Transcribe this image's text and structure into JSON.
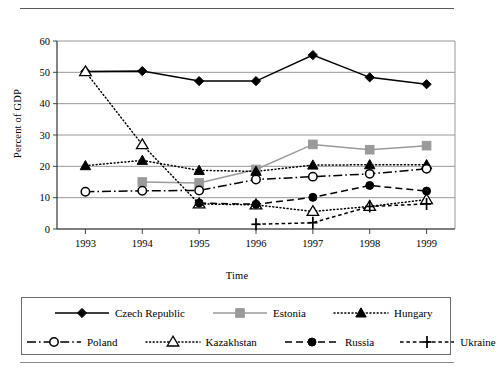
{
  "chart_data": {
    "type": "line",
    "title": "",
    "xlabel": "Time",
    "ylabel": "Percent of GDP",
    "categories": [
      "1993",
      "1994",
      "1995",
      "1996",
      "1997",
      "1998",
      "1999"
    ],
    "x": [
      1993,
      1994,
      1995,
      1996,
      1997,
      1998,
      1999
    ],
    "xlim": [
      1992.5,
      1999.5
    ],
    "ylim": [
      0,
      60
    ],
    "yticks": [
      0,
      10,
      20,
      30,
      40,
      50,
      60
    ],
    "ytick_labels": [
      "0",
      "10",
      "20",
      "30",
      "40",
      "50",
      "60"
    ],
    "grid": "horizontal",
    "legend_position": "below-plot",
    "series": [
      {
        "name": "Czech Republic",
        "color": "#000000",
        "marker": "diamond",
        "line_style": "solid",
        "x": [
          1993,
          1994,
          1995,
          1996,
          1997,
          1998,
          1999
        ],
        "values": [
          50.3,
          50.4,
          47.2,
          47.2,
          55.5,
          48.4,
          46.2
        ]
      },
      {
        "name": "Estonia",
        "color": "#9a9a9a",
        "marker": "square",
        "line_style": "solid",
        "x": [
          1994,
          1995,
          1996,
          1997,
          1998,
          1999
        ],
        "values": [
          15.0,
          14.7,
          19.0,
          27.0,
          25.3,
          26.6
        ]
      },
      {
        "name": "Hungary",
        "color": "#000000",
        "marker": "triangle-filled",
        "line_style": "dotted",
        "x": [
          1993,
          1994,
          1995,
          1996,
          1997,
          1998,
          1999
        ],
        "values": [
          20.2,
          21.9,
          18.7,
          18.4,
          20.4,
          20.5,
          20.5
        ]
      },
      {
        "name": "Poland",
        "color": "#000000",
        "marker": "circle-open",
        "line_style": "dash-dot",
        "x": [
          1993,
          1994,
          1995,
          1996,
          1997,
          1998,
          1999
        ],
        "values": [
          11.9,
          12.2,
          12.3,
          15.8,
          16.7,
          17.6,
          19.2
        ]
      },
      {
        "name": "Kazakhstan",
        "color": "#000000",
        "marker": "triangle-open",
        "line_style": "dotted",
        "x": [
          1993,
          1994,
          1995,
          1996,
          1997,
          1998,
          1999
        ],
        "values": [
          50.2,
          26.9,
          8.0,
          7.7,
          5.6,
          7.2,
          9.4
        ]
      },
      {
        "name": "Russia",
        "color": "#000000",
        "marker": "circle-filled",
        "line_style": "dashed",
        "x": [
          1995,
          1996,
          1997,
          1998,
          1999
        ],
        "values": [
          8.3,
          7.9,
          10.1,
          13.9,
          12.1
        ]
      },
      {
        "name": "Ukraine",
        "color": "#000000",
        "marker": "plus",
        "line_style": "dashed-fine",
        "x": [
          1996,
          1997,
          1998,
          1999
        ],
        "values": [
          1.5,
          2.0,
          7.2,
          8.0
        ]
      }
    ]
  },
  "legend": {
    "rows": [
      [
        {
          "label": "Czech Republic",
          "key": "czech-republic"
        },
        {
          "label": "Estonia",
          "key": "estonia"
        },
        {
          "label": "Hungary",
          "key": "hungary"
        }
      ],
      [
        {
          "label": "Poland",
          "key": "poland"
        },
        {
          "label": "Kazakhstan",
          "key": "kazakhstan"
        },
        {
          "label": "Russia",
          "key": "russia"
        },
        {
          "label": "Ukraine",
          "key": "ukraine"
        }
      ]
    ]
  }
}
